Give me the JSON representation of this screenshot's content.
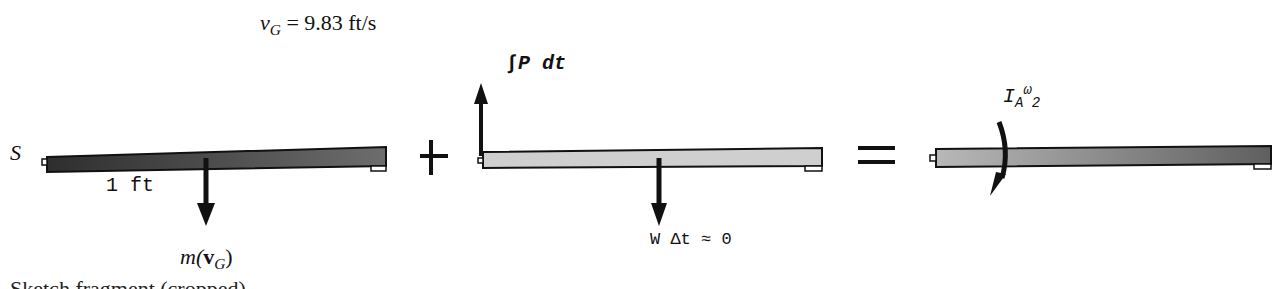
{
  "figure": {
    "velocity_label": {
      "var": "v",
      "sub": "G",
      "rest": " = 9.83 ft/s"
    },
    "panel1": {
      "point_label": "S",
      "length_label": "1 ft",
      "momentum_label": {
        "pre": "m(",
        "bold": "v",
        "sub": "G",
        "post": ")"
      },
      "bar_fill": "#3a3a3a"
    },
    "plus_sign": "+",
    "panel2": {
      "impulse_label": "∫P dt",
      "weight_label": "W Δt ≈ 0",
      "bar_fill": "#c8c8c8"
    },
    "equals_sign": "=",
    "panel3": {
      "angular_momentum_label": {
        "I": "I",
        "sub": "A",
        "omega": "ω",
        "omega_sub": "2"
      },
      "bar_fill": "#8a8a8a"
    },
    "cut_text": "Sketch fragment (cropped)"
  }
}
